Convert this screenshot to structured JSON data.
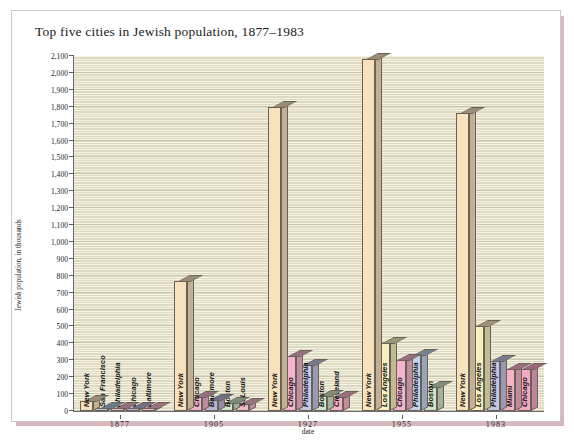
{
  "chart": {
    "title": "Top five cities in Jewish population, 1877–1983",
    "ylabel": "Jewish population, in thousands",
    "xlabel": "date"
  },
  "chart_data": {
    "type": "bar",
    "title": "Top five cities in Jewish population, 1877–1983",
    "xlabel": "date",
    "ylabel": "Jewish population, in thousands",
    "ylim": [
      0,
      2100
    ],
    "ytick_step": 100,
    "ytick_labels": [
      "0",
      "100",
      "200",
      "300",
      "400",
      "500",
      "600",
      "700",
      "800",
      "900",
      "1,000",
      "1,100",
      "1,200",
      "1,300",
      "1,400",
      "1,500",
      "1,600",
      "1,700",
      "1,800",
      "1,900",
      "2,000",
      "2,100"
    ],
    "grid": true,
    "legend": "none",
    "categories": [
      "1877",
      "1905",
      "1927",
      "1955",
      "1983"
    ],
    "groups": [
      {
        "date": "1877",
        "bars": [
          {
            "city": "New York",
            "value": 60,
            "color": "#f8e2bc"
          },
          {
            "city": "San Francisco",
            "value": 16,
            "color": "#aac4e0"
          },
          {
            "city": "Philadelphia",
            "value": 12,
            "color": "#e8b7c8"
          },
          {
            "city": "Chicago",
            "value": 10,
            "color": "#b9b3d6"
          },
          {
            "city": "Baltimore",
            "value": 10,
            "color": "#f3b9c9"
          }
        ]
      },
      {
        "date": "1905",
        "bars": [
          {
            "city": "New York",
            "value": 770,
            "color": "#f8e2bc"
          },
          {
            "city": "Chicago",
            "value": 80,
            "color": "#f3b2cb"
          },
          {
            "city": "Baltimore",
            "value": 65,
            "color": "#b9b3d6"
          },
          {
            "city": "Boston",
            "value": 45,
            "color": "#cfe3c6"
          },
          {
            "city": "St Louis",
            "value": 40,
            "color": "#f3b9c9"
          }
        ]
      },
      {
        "date": "1927",
        "bars": [
          {
            "city": "New York",
            "value": 1800,
            "color": "#f8e2bc"
          },
          {
            "city": "Chicago",
            "value": 325,
            "color": "#f5b3cd"
          },
          {
            "city": "Philadelphia",
            "value": 270,
            "color": "#c3c6e4"
          },
          {
            "city": "Boston",
            "value": 90,
            "color": "#cfe3c6"
          },
          {
            "city": "Cleveland",
            "value": 85,
            "color": "#f6b3c6"
          }
        ]
      },
      {
        "date": "1955",
        "bars": [
          {
            "city": "New York",
            "value": 2080,
            "color": "#f8e2bc"
          },
          {
            "city": "Los Angeles",
            "value": 400,
            "color": "#f7f0bd"
          },
          {
            "city": "Chicago",
            "value": 300,
            "color": "#f5b3cd"
          },
          {
            "city": "Philadelphia",
            "value": 330,
            "color": "#bfd3ef"
          },
          {
            "city": "Boston",
            "value": 140,
            "color": "#cfe3c6"
          }
        ]
      },
      {
        "date": "1983",
        "bars": [
          {
            "city": "New York",
            "value": 1760,
            "color": "#f8e2bc"
          },
          {
            "city": "Los Angeles",
            "value": 500,
            "color": "#f7f0bd"
          },
          {
            "city": "Philadelphia",
            "value": 295,
            "color": "#c3c6e4"
          },
          {
            "city": "Miami",
            "value": 250,
            "color": "#f6b3c6"
          },
          {
            "city": "Chicago",
            "value": 248,
            "color": "#f5a9c6"
          }
        ]
      }
    ]
  },
  "colors": {
    "plot_background": "#f5f2e2",
    "card_background": "#ffffff",
    "shadow": "#d9b6bd",
    "axis": "#6d6d6d"
  }
}
